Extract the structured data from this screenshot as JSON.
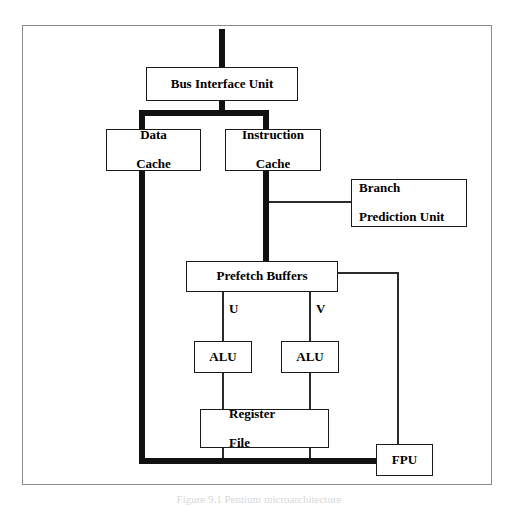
{
  "figure": {
    "caption": "Figure 9.1 Pentium microarchitecture",
    "frame_color": "#8a8a8a",
    "bus_color": "#111111",
    "wire_color": "#2b2b2b",
    "background": "#ffffff"
  },
  "nodes": {
    "bus_interface_unit": {
      "label": "Bus Interface Unit",
      "font_size": 13
    },
    "data_cache": {
      "label": "Data\nCache",
      "line1": "Data",
      "line2": "Cache",
      "font_size": 13
    },
    "instruction_cache": {
      "label": "Instruction\nCache",
      "line1": "Instruction",
      "line2": "Cache",
      "font_size": 13
    },
    "branch_prediction_unit": {
      "line1": "Branch",
      "line2": "Prediction Unit",
      "font_size": 13
    },
    "prefetch_buffers": {
      "label": "Prefetch Buffers",
      "font_size": 13
    },
    "alu_u": {
      "label": "ALU",
      "font_size": 13
    },
    "alu_v": {
      "label": "ALU",
      "font_size": 13
    },
    "register_file": {
      "line1": "Register",
      "line2": "File",
      "font_size": 13
    },
    "fpu": {
      "label": "FPU",
      "font_size": 13
    }
  },
  "pipe_labels": {
    "u": "U",
    "v": "V"
  }
}
